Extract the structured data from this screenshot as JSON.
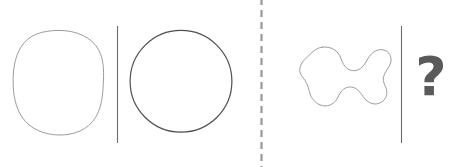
{
  "puzzle": {
    "title": "Shape analogy puzzle",
    "background_color": "#ffffff",
    "width": 453,
    "height": 167,
    "question_mark": "?",
    "question_mark_color": "#5a5a5a",
    "divider_color": "#6b6b6b",
    "dashed_separator_color": "#9a9a9a",
    "left_group": {
      "name": "example-pair",
      "items": [
        {
          "id": "shape-a",
          "label": "hand-drawn rounded blob circle",
          "stroke_color": "#9c9c9c",
          "stroke_width": 1,
          "bbox": [
            13,
            30,
            90,
            105
          ]
        },
        {
          "id": "shape-b",
          "label": "smooth circle",
          "stroke_color": "#4f4f4f",
          "stroke_width": 1.2,
          "bbox": [
            130,
            30,
            102,
            102
          ]
        }
      ],
      "divider": {
        "id": "divider-left",
        "x": 117,
        "y1": 26,
        "y2": 143
      }
    },
    "right_group": {
      "name": "query-pair",
      "items": [
        {
          "id": "shape-c",
          "label": "irregular bone-shaped blob",
          "stroke_color": "#9c9c9c",
          "stroke_width": 1,
          "bbox": [
            299,
            46,
            92,
            60
          ]
        },
        {
          "id": "shape-d",
          "label": "unknown answer",
          "display": "?"
        }
      ],
      "divider": {
        "id": "divider-right",
        "x": 401,
        "y1": 26,
        "y2": 143
      }
    },
    "separator": {
      "id": "dashed-separator",
      "x": 261,
      "y1": 0,
      "y2": 167,
      "dash": "7 5"
    }
  }
}
